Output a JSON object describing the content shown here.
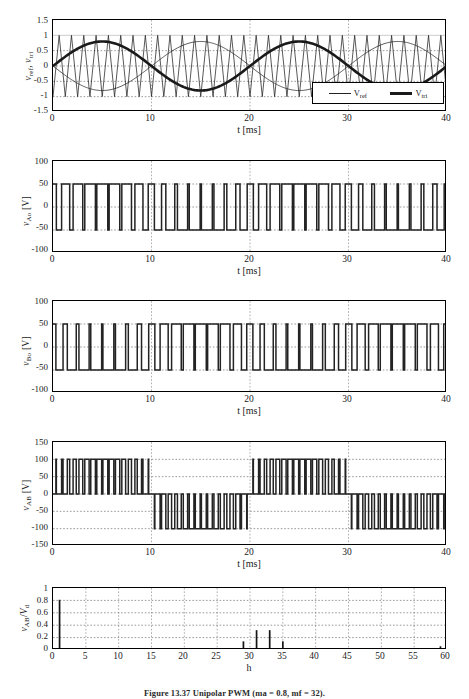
{
  "figure": {
    "caption": "Figure 13.37   Unipolar PWM (ma = 0.8, mf = 32).",
    "background": "#ffffff",
    "line_color": "#222222"
  },
  "chart_data": [
    {
      "type": "line",
      "name": "modulation",
      "title": "",
      "xlabel": "t [ms]",
      "ylabel": "v_ref , v_tri",
      "ylabel_parts": [
        {
          "base": "v",
          "sub": "ref"
        },
        {
          "base": "v",
          "sub": "tri"
        }
      ],
      "xlim": [
        0,
        40
      ],
      "ylim": [
        -1.5,
        1.5
      ],
      "xticks": [
        0,
        10,
        20,
        30,
        40
      ],
      "yticks": [
        1.5,
        1,
        0.5,
        0,
        -0.5,
        -1,
        -1.5
      ],
      "ytick_labels": [
        "1.5",
        "1",
        "0.5",
        "0",
        "-0.5",
        "-1",
        "-1.5"
      ],
      "grid": true,
      "legend_position": "lower-right",
      "legend": [
        {
          "label": "V_ref",
          "base": "V",
          "sub": "ref",
          "style": "thin"
        },
        {
          "label": "V_tri",
          "base": "V",
          "sub": "tri",
          "style": "thick"
        }
      ],
      "series": [
        {
          "name": "v_tri_carrier",
          "kind": "triangle",
          "amplitude": 1.0,
          "cycles": 32,
          "style": "thin"
        },
        {
          "name": "v_ref_a",
          "kind": "sine",
          "amplitude": 0.8,
          "periods": 2,
          "phase_deg": 0,
          "style": "thick"
        },
        {
          "name": "v_ref_b",
          "kind": "sine",
          "amplitude": 0.8,
          "periods": 2,
          "phase_deg": 180,
          "style": "thin"
        }
      ]
    },
    {
      "type": "line",
      "name": "v_Ao",
      "xlabel": "t [ms]",
      "ylabel": "v_Ao [V]",
      "ylabel_base": "v",
      "ylabel_sub": "Ao",
      "ylabel_unit": "[V]",
      "xlim": [
        0,
        40
      ],
      "ylim": [
        -100,
        100
      ],
      "xticks": [
        0,
        10,
        20,
        30,
        40
      ],
      "yticks": [
        100,
        50,
        0,
        -50,
        -100
      ],
      "ytick_labels": [
        "100",
        "50",
        "0",
        "-50",
        "-100"
      ],
      "grid": true,
      "waveform": {
        "kind": "pwm_bipolar",
        "high": 50,
        "low": -50,
        "carrier_cycles": 32,
        "ma": 0.8,
        "phase_deg": 0
      }
    },
    {
      "type": "line",
      "name": "v_Bo",
      "xlabel": "t [ms]",
      "ylabel": "v_Bo [V]",
      "ylabel_base": "v",
      "ylabel_sub": "Bo",
      "ylabel_unit": "[V]",
      "xlim": [
        0,
        40
      ],
      "ylim": [
        -100,
        100
      ],
      "xticks": [
        0,
        10,
        20,
        30,
        40
      ],
      "yticks": [
        100,
        50,
        0,
        -50,
        -100
      ],
      "ytick_labels": [
        "100",
        "50",
        "0",
        "-50",
        "-100"
      ],
      "grid": true,
      "waveform": {
        "kind": "pwm_bipolar",
        "high": 50,
        "low": -50,
        "carrier_cycles": 32,
        "ma": 0.8,
        "phase_deg": 180
      }
    },
    {
      "type": "line",
      "name": "v_AB",
      "xlabel": "t [ms]",
      "ylabel": "v_AB [V]",
      "ylabel_base": "v",
      "ylabel_sub": "AB",
      "ylabel_unit": "[V]",
      "xlim": [
        0,
        40
      ],
      "ylim": [
        -150,
        150
      ],
      "xticks": [
        0,
        10,
        20,
        30,
        40
      ],
      "yticks": [
        150,
        100,
        50,
        0,
        -50,
        -100,
        -150
      ],
      "ytick_labels": [
        "150",
        "100",
        "50",
        "0",
        "-50",
        "-100",
        "-150"
      ],
      "grid": true,
      "waveform": {
        "kind": "pwm_unipolar",
        "high": 100,
        "low": -100,
        "zero": 0,
        "carrier_cycles": 32,
        "ma": 0.8
      }
    },
    {
      "type": "bar",
      "name": "harmonic_spectrum",
      "xlabel": "h",
      "ylabel": "v_AB/V_d",
      "ylabel_num_base": "v",
      "ylabel_num_sub": "AB",
      "ylabel_den_base": "V",
      "ylabel_den_sub": "d",
      "xlim": [
        0,
        60
      ],
      "ylim": [
        0,
        1
      ],
      "xticks": [
        0,
        5,
        10,
        15,
        20,
        25,
        30,
        35,
        40,
        45,
        50,
        55,
        60
      ],
      "yticks": [
        1,
        0.8,
        0.6,
        0.4,
        0.2,
        0
      ],
      "ytick_labels": [
        "1",
        "0.8",
        "0.6",
        "0.4",
        "0.2",
        "0"
      ],
      "grid": true,
      "harmonics": [
        {
          "h": 1,
          "value": 0.81
        },
        {
          "h": 29,
          "value": 0.14
        },
        {
          "h": 31,
          "value": 0.32
        },
        {
          "h": 33,
          "value": 0.32
        },
        {
          "h": 35,
          "value": 0.14
        },
        {
          "h": 59,
          "value": 0.06
        }
      ]
    }
  ]
}
